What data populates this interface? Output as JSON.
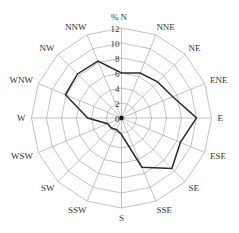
{
  "chart_data": {
    "type": "radar",
    "subtype": "wind-rose",
    "title": "",
    "unit_label": "%",
    "categories": [
      "N",
      "NNE",
      "NE",
      "ENE",
      "E",
      "ESE",
      "SE",
      "SSE",
      "S",
      "SSW",
      "SW",
      "WSW",
      "W",
      "WNW",
      "NW",
      "NNW"
    ],
    "series": [
      {
        "name": "Wind frequency",
        "values": [
          6.0,
          6.5,
          6.8,
          7.4,
          10.0,
          8.5,
          9.5,
          7.1,
          2.2,
          1.7,
          1.9,
          2.0,
          4.5,
          8.1,
          8.3,
          8.2
        ],
        "color": "#2b2b2b"
      }
    ],
    "radial_ticks": [
      0,
      2,
      4,
      6,
      8,
      10,
      12
    ],
    "rlim": [
      0,
      12
    ],
    "grid": true,
    "legend": null
  },
  "colors": {
    "grid": "#9a9a9a",
    "series": "#2b2b2b",
    "text": "#333333",
    "background": "#ffffff"
  }
}
